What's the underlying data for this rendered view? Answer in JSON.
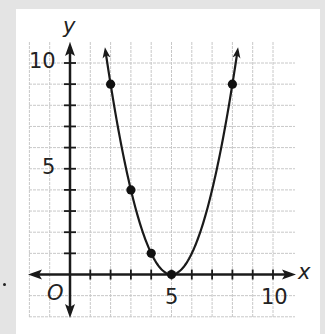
{
  "chart_data": {
    "type": "line",
    "title": "",
    "xlabel": "x",
    "ylabel": "y",
    "origin_label": "O",
    "function": "y = (x - 5)^2",
    "xlim": [
      -2,
      11
    ],
    "ylim": [
      -2,
      11
    ],
    "grid": true,
    "x_tick_labels": [
      "5",
      "10"
    ],
    "y_tick_labels": [
      "5",
      "10"
    ],
    "points": [
      {
        "x": 2,
        "y": 9
      },
      {
        "x": 3,
        "y": 4
      },
      {
        "x": 4,
        "y": 1
      },
      {
        "x": 5,
        "y": 0
      },
      {
        "x": 8,
        "y": 9
      }
    ],
    "curve_x_range": [
      1.75,
      8.25
    ],
    "arrows_at_ends": true,
    "colors": {
      "curve": "#1a1a1a",
      "grid": "#c8c8c8",
      "axes": "#1a1a1a",
      "background": "#ffffff",
      "page": "#e4e4e4"
    }
  },
  "labels": {
    "x_axis": "x",
    "y_axis": "y",
    "origin": "O",
    "x5": "5",
    "x10": "10",
    "y5": "5",
    "y10": "10"
  }
}
